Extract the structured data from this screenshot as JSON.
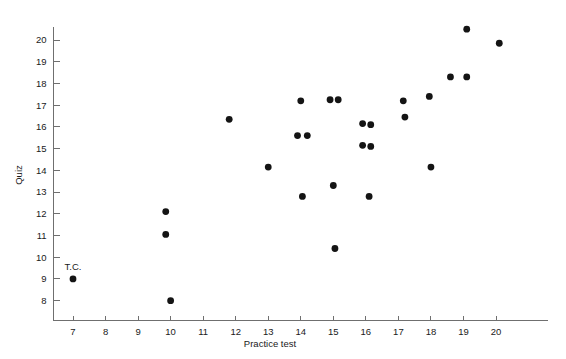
{
  "chart_data": {
    "type": "scatter",
    "title": "",
    "subtitle": "",
    "xlabel": "Practice test",
    "ylabel": "Quiz",
    "xlim": [
      6.4,
      21.0
    ],
    "ylim": [
      7.45,
      20.9
    ],
    "xticks": [
      7,
      8,
      9,
      10,
      11,
      12,
      13,
      14,
      15,
      16,
      17,
      18,
      19,
      20
    ],
    "yticks": [
      8,
      9,
      10,
      11,
      12,
      13,
      14,
      15,
      16,
      17,
      18,
      19,
      20
    ],
    "grid": false,
    "legend": null,
    "legend_position": "none",
    "marker": "filled-circle",
    "marker_color": "#141414",
    "marker_size_px": 3.4,
    "points": [
      {
        "x": 7.0,
        "y": 9.0,
        "label": "T.C."
      },
      {
        "x": 9.85,
        "y": 12.1,
        "label": ""
      },
      {
        "x": 9.85,
        "y": 11.05,
        "label": ""
      },
      {
        "x": 10.0,
        "y": 8.0,
        "label": ""
      },
      {
        "x": 11.8,
        "y": 16.35,
        "label": ""
      },
      {
        "x": 13.0,
        "y": 14.15,
        "label": ""
      },
      {
        "x": 14.0,
        "y": 17.2,
        "label": ""
      },
      {
        "x": 13.9,
        "y": 15.6,
        "label": ""
      },
      {
        "x": 14.2,
        "y": 15.6,
        "label": ""
      },
      {
        "x": 14.05,
        "y": 12.8,
        "label": ""
      },
      {
        "x": 14.9,
        "y": 17.25,
        "label": ""
      },
      {
        "x": 15.15,
        "y": 17.25,
        "label": ""
      },
      {
        "x": 15.0,
        "y": 13.3,
        "label": ""
      },
      {
        "x": 15.05,
        "y": 10.4,
        "label": ""
      },
      {
        "x": 15.9,
        "y": 16.15,
        "label": ""
      },
      {
        "x": 16.15,
        "y": 16.1,
        "label": ""
      },
      {
        "x": 15.9,
        "y": 15.15,
        "label": ""
      },
      {
        "x": 16.15,
        "y": 15.1,
        "label": ""
      },
      {
        "x": 16.1,
        "y": 12.8,
        "label": ""
      },
      {
        "x": 17.15,
        "y": 17.2,
        "label": ""
      },
      {
        "x": 17.2,
        "y": 16.45,
        "label": ""
      },
      {
        "x": 17.95,
        "y": 17.4,
        "label": ""
      },
      {
        "x": 18.0,
        "y": 14.15,
        "label": ""
      },
      {
        "x": 18.6,
        "y": 18.3,
        "label": ""
      },
      {
        "x": 19.1,
        "y": 18.3,
        "label": ""
      },
      {
        "x": 19.1,
        "y": 20.5,
        "label": ""
      },
      {
        "x": 20.1,
        "y": 19.85,
        "label": ""
      }
    ]
  },
  "axes": {
    "x_tick_labels": [
      "7",
      "8",
      "9",
      "10",
      "11",
      "12",
      "13",
      "14",
      "15",
      "16",
      "17",
      "18",
      "19",
      "20"
    ],
    "y_tick_labels": [
      "20",
      "19",
      "18",
      "17",
      "16",
      "15",
      "14",
      "13",
      "12",
      "11",
      "10",
      "9",
      "8"
    ],
    "x_axis_title": "Practice test",
    "y_axis_title": "Quiz",
    "axis_color": "#6f6f6f"
  },
  "annotations": [
    {
      "text": "T.C.",
      "x": 7.0,
      "y": 9.0
    }
  ]
}
